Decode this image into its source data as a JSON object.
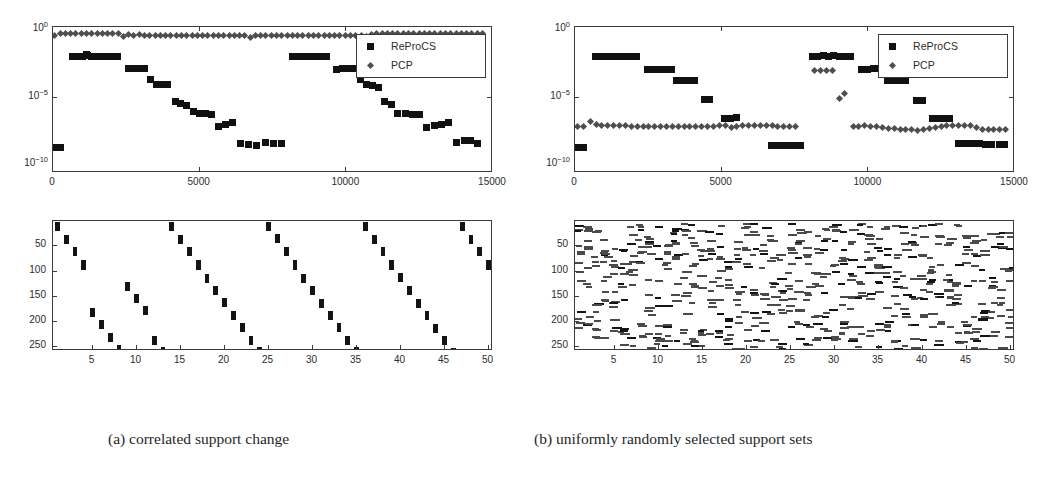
{
  "figure": {
    "captions": {
      "a": "(a) correlated support change",
      "b": "(b) uniformly randomly selected support sets"
    }
  },
  "legend": {
    "reprocs_label": "ReProCS",
    "pcp_label": "PCP",
    "reprocs_marker": "square-marker",
    "pcp_marker": "diamond-marker"
  },
  "colors": {
    "reprocs": "#111111",
    "pcp": "#4e4e4e",
    "axis": "#3a3a3a",
    "background": "#ffffff",
    "support_block": "#141414"
  },
  "error_axes": {
    "ylabels": [
      "10^0",
      "10^-5",
      "10^-10"
    ],
    "ytick_values": [
      0,
      -5,
      -10
    ],
    "ylim_exp": [
      -10.6,
      0.25
    ],
    "xlabels": [
      "0",
      "5000",
      "10000",
      "15000"
    ],
    "xtick_values": [
      0,
      5000,
      10000,
      15000
    ],
    "xlim": [
      0,
      15000
    ]
  },
  "support_axes": {
    "ylabels": [
      "50",
      "100",
      "150",
      "200",
      "250"
    ],
    "ytick_values": [
      50,
      100,
      150,
      200,
      250
    ],
    "ylim": [
      0,
      257
    ],
    "xlabels": [
      "5",
      "10",
      "15",
      "20",
      "25",
      "30",
      "35",
      "40",
      "45",
      "50"
    ],
    "xtick_values": [
      5,
      10,
      15,
      20,
      25,
      30,
      35,
      40,
      45,
      50
    ],
    "xlim": [
      0.5,
      50.5
    ]
  },
  "chart_data": [
    {
      "id": "error-plot-a",
      "type": "scatter",
      "title": "",
      "xlabel": "",
      "ylabel": "",
      "yscale": "log",
      "xlim": [
        0,
        15000
      ],
      "ylim": [
        1e-10,
        1.0
      ],
      "grid": false,
      "legend_position": "upper-right",
      "series": [
        {
          "name": "ReProCS",
          "marker": "square",
          "color": "#111111",
          "x": [
            100,
            260,
            660,
            840,
            1000,
            1140,
            1180,
            1300,
            1480,
            1660,
            1840,
            2020,
            2200,
            2560,
            2740,
            2940,
            3120,
            3320,
            3520,
            3740,
            3920,
            4160,
            4360,
            4560,
            4780,
            5000,
            5200,
            5400,
            5640,
            5880,
            6120,
            6380,
            6660,
            6940,
            7240,
            7520,
            7800,
            8160,
            8360,
            8560,
            8760,
            8940,
            9140,
            9340,
            9660,
            9860,
            10060,
            10260,
            10480,
            10680,
            10880,
            11080,
            11300,
            11540,
            11760,
            12000,
            12240,
            12480,
            12740,
            13000,
            13240,
            13480,
            13760,
            14020,
            14240,
            14460
          ],
          "y": [
            2e-09,
            2e-09,
            0.011,
            0.011,
            0.012,
            0.015,
            0.014,
            0.012,
            0.011,
            0.011,
            0.012,
            0.012,
            0.012,
            0.0014,
            0.0015,
            0.0015,
            0.0015,
            0.00022,
            9e-05,
            9e-05,
            9e-05,
            5e-06,
            3.5e-06,
            2.5e-06,
            1e-06,
            7e-07,
            7e-07,
            5.5e-07,
            7e-08,
            1e-07,
            1.5e-07,
            4e-09,
            3.5e-09,
            3e-09,
            5e-09,
            4e-09,
            4e-09,
            0.012,
            0.012,
            0.011,
            0.012,
            0.012,
            0.012,
            0.012,
            0.0013,
            0.0014,
            0.0014,
            0.0014,
            0.00022,
            9e-05,
            8e-05,
            6e-05,
            5e-06,
            3e-06,
            7e-07,
            7e-07,
            6e-07,
            5.5e-07,
            6.5e-08,
            9e-08,
            1e-07,
            1.4e-07,
            5e-09,
            7e-09,
            6e-09,
            4e-09
          ],
          "note": "staircase decay repeating twice"
        },
        {
          "name": "PCP",
          "marker": "diamond",
          "color": "#4e4e4e",
          "x": [
            60,
            240,
            420,
            600,
            780,
            960,
            1140,
            1320,
            1500,
            1680,
            1860,
            2040,
            2220,
            2400,
            2580,
            2760,
            2940,
            3120,
            3300,
            3480,
            3660,
            3840,
            4020,
            4200,
            4380,
            4560,
            4740,
            4920,
            5100,
            5280,
            5460,
            5640,
            5820,
            6000,
            6180,
            6360,
            6540,
            6720,
            6900,
            7080,
            7260,
            7440,
            7620,
            7800,
            7980,
            8160,
            8340,
            8520,
            8700,
            8880,
            9060,
            9240,
            9420,
            9600,
            9780,
            9960,
            10140,
            10320,
            10500,
            10680,
            10860,
            11040,
            11220,
            11400,
            11580,
            11760,
            11940,
            12120,
            12300,
            12480,
            12660,
            12840,
            13020,
            13200,
            13380,
            13560,
            13740,
            13920,
            14100,
            14280,
            14460,
            14640
          ],
          "y": [
            0.45,
            0.62,
            0.62,
            0.62,
            0.62,
            0.6,
            0.58,
            0.62,
            0.62,
            0.62,
            0.6,
            0.58,
            0.55,
            0.35,
            0.5,
            0.45,
            0.48,
            0.45,
            0.45,
            0.45,
            0.45,
            0.45,
            0.45,
            0.45,
            0.45,
            0.45,
            0.45,
            0.45,
            0.45,
            0.45,
            0.45,
            0.45,
            0.45,
            0.45,
            0.42,
            0.45,
            0.45,
            0.3,
            0.4,
            0.45,
            0.45,
            0.45,
            0.45,
            0.45,
            0.45,
            0.45,
            0.45,
            0.45,
            0.45,
            0.45,
            0.45,
            0.45,
            0.45,
            0.45,
            0.45,
            0.45,
            0.45,
            0.45,
            0.4,
            0.35,
            0.48,
            0.55,
            0.58,
            0.6,
            0.6,
            0.6,
            0.6,
            0.6,
            0.6,
            0.6,
            0.6,
            0.6,
            0.6,
            0.6,
            0.6,
            0.6,
            0.6,
            0.6,
            0.6,
            0.6,
            0.6,
            0.6
          ],
          "note": "near constant high error around 0.5"
        }
      ]
    },
    {
      "id": "error-plot-b",
      "type": "scatter",
      "title": "",
      "xlabel": "",
      "ylabel": "",
      "yscale": "log",
      "xlim": [
        0,
        15000
      ],
      "ylim": [
        1e-10,
        1.0
      ],
      "grid": false,
      "legend_position": "upper-right",
      "series": [
        {
          "name": "ReProCS",
          "marker": "square",
          "color": "#111111",
          "x": [
            100,
            280,
            700,
            900,
            1100,
            1300,
            1500,
            1700,
            1900,
            2100,
            2480,
            2680,
            2880,
            3080,
            3280,
            3460,
            3660,
            3860,
            4060,
            4400,
            4600,
            5100,
            5300,
            5500,
            6700,
            6900,
            7100,
            7300,
            7500,
            7700,
            8080,
            8280,
            8460,
            8640,
            8820,
            9000,
            9180,
            9380,
            9780,
            9980,
            10180,
            10380,
            10660,
            10860,
            11060,
            11260,
            11640,
            11840,
            12180,
            12380,
            12580,
            12780,
            13060,
            13240,
            13420,
            13600,
            13800,
            14000,
            14200,
            14460,
            14640
          ],
          "y": [
            2e-09,
            2e-09,
            0.012,
            0.012,
            0.012,
            0.012,
            0.012,
            0.012,
            0.012,
            0.012,
            0.0013,
            0.0013,
            0.0013,
            0.0013,
            0.0013,
            0.0002,
            0.0002,
            0.0002,
            0.0002,
            7e-06,
            7e-06,
            3e-07,
            3e-07,
            3.5e-07,
            3e-09,
            3e-09,
            3e-09,
            3e-09,
            3e-09,
            3e-09,
            0.012,
            0.011,
            0.013,
            0.011,
            0.013,
            0.012,
            0.012,
            0.012,
            0.0013,
            0.0013,
            0.0014,
            0.0014,
            0.00018,
            0.00018,
            0.00018,
            0.00018,
            6e-06,
            6e-06,
            3e-07,
            3e-07,
            3e-07,
            3e-07,
            4e-09,
            4e-09,
            4e-09,
            4e-09,
            4e-09,
            3.5e-09,
            3.5e-09,
            3.5e-09,
            3.5e-09
          ],
          "note": "two identical staircase decay cycles"
        },
        {
          "name": "PCP",
          "marker": "diamond",
          "color": "#4e4e4e",
          "x": [
            100,
            300,
            520,
            720,
            920,
            1120,
            1320,
            1520,
            1720,
            1920,
            2120,
            2320,
            2520,
            2720,
            2920,
            3120,
            3320,
            3520,
            3720,
            3920,
            4120,
            4320,
            4520,
            4720,
            4920,
            5120,
            5320,
            5520,
            5720,
            5920,
            6120,
            6320,
            6520,
            6720,
            6920,
            7120,
            7320,
            7520,
            8180,
            8380,
            8580,
            8780,
            9000,
            9200,
            9480,
            9680,
            9880,
            10080,
            10280,
            10480,
            10680,
            10880,
            11080,
            11280,
            11480,
            11680,
            11880,
            12080,
            12280,
            12480,
            12680,
            12880,
            13080,
            13280,
            13480,
            13680,
            13880,
            14080,
            14280,
            14480,
            14680
          ],
          "y": [
            7e-08,
            7e-08,
            1.6e-07,
            1e-07,
            9e-08,
            9e-08,
            8e-08,
            8e-08,
            8e-08,
            7.5e-08,
            7.5e-08,
            7.5e-08,
            7e-08,
            7e-08,
            7e-08,
            7e-08,
            7e-08,
            7e-08,
            7e-08,
            7e-08,
            7e-08,
            7e-08,
            7.5e-08,
            7.5e-08,
            8e-08,
            8e-08,
            6.5e-08,
            7e-08,
            8e-08,
            9e-08,
            8.5e-08,
            8e-08,
            8e-08,
            8e-08,
            7.5e-08,
            7.5e-08,
            7e-08,
            7e-08,
            0.001,
            0.001,
            0.0011,
            0.0011,
            9e-06,
            2e-05,
            7e-08,
            7.5e-08,
            8e-08,
            7.5e-08,
            7e-08,
            6e-08,
            5.5e-08,
            5e-08,
            4.5e-08,
            4e-08,
            4e-08,
            3.5e-08,
            4.5e-08,
            5.5e-08,
            6.5e-08,
            7.5e-08,
            8e-08,
            8.5e-08,
            8.5e-08,
            8.5e-08,
            8e-08,
            6e-08,
            4e-08,
            4e-08,
            4e-08,
            4e-08,
            4e-08
          ],
          "note": "low flat error with two spikes near 9000"
        }
      ]
    },
    {
      "id": "support-plot-a",
      "type": "heatmap",
      "title": "",
      "xlabel": "",
      "ylabel": "",
      "xlim": [
        0.5,
        50.5
      ],
      "ylim": [
        0,
        257
      ],
      "grid": false,
      "pattern": "correlated-diagonal-staircase",
      "n_columns": 50,
      "n_rows": 256,
      "block_height": 18,
      "block_width": 0.55,
      "column_starts": [
        2,
        28,
        52,
        78,
        172,
        196,
        222,
        246,
        120,
        144,
        168,
        228,
        250,
        2,
        28,
        52,
        78,
        104,
        128,
        152,
        178,
        202,
        228,
        250,
        2,
        26,
        52,
        78,
        104,
        128,
        154,
        178,
        202,
        228,
        250,
        2,
        28,
        52,
        78,
        102,
        128,
        154,
        178,
        204,
        228,
        252,
        2,
        28,
        52,
        78
      ],
      "note": "one contiguous support block per column, descending diagonally and wrapping"
    },
    {
      "id": "support-plot-b",
      "type": "heatmap",
      "title": "",
      "xlabel": "",
      "ylabel": "",
      "xlim": [
        0.5,
        50.5
      ],
      "ylim": [
        0,
        257
      ],
      "grid": false,
      "pattern": "uniformly-random-scatter",
      "n_columns": 50,
      "n_rows": 256,
      "marks_per_column": 13,
      "block_height": 4,
      "block_width": 0.9,
      "note": "uniformly randomly selected support indices, small horizontal dashes scattered"
    }
  ]
}
